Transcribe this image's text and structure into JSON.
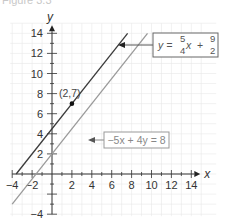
{
  "caption": "Figure 3.3",
  "chart_data": {
    "type": "line",
    "title": "",
    "xlabel": "x",
    "ylabel": "y",
    "xlim": [
      -4,
      14
    ],
    "ylim": [
      -4,
      14
    ],
    "grid": true,
    "x_ticks": [
      -4,
      -2,
      2,
      4,
      6,
      8,
      10,
      12,
      14
    ],
    "y_ticks": [
      -4,
      2,
      4,
      6,
      8,
      10,
      12,
      14
    ],
    "series": [
      {
        "name": "y = 5/4 x + 9/2",
        "slope": 1.25,
        "intercept": 4.5,
        "x_range": [
          -3.6,
          7.6
        ],
        "color": "#3a3a3a"
      },
      {
        "name": "-5x + 4y = 8",
        "slope": 1.25,
        "intercept": 2,
        "x_range": [
          -4,
          9.6
        ],
        "color": "#9a9a9a"
      }
    ],
    "points": [
      {
        "x": 2,
        "y": 7,
        "label": "(2,7)"
      }
    ],
    "annotations": [
      {
        "text": "y = 5/4 x + 9/2",
        "target_series": 0
      },
      {
        "text": "−5x + 4y = 8",
        "target_series": 1
      }
    ]
  },
  "labels": {
    "x_axis": "x",
    "y_axis": "y",
    "point": "(2,7)",
    "eq1_y": "y =",
    "eq1_n1": "5",
    "eq1_d1": "4",
    "eq1_x": "x",
    "eq1_plus": "+",
    "eq1_n2": "9",
    "eq1_d2": "2",
    "eq2": "−5x + 4y = 8"
  }
}
